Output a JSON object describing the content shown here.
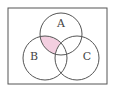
{
  "diagram": {
    "type": "venn",
    "universe": {
      "x": 8,
      "y": 8,
      "width": 99,
      "height": 76
    },
    "sets": [
      {
        "label": "A",
        "cx": 61,
        "cy": 34,
        "r": 21,
        "label_x": 61,
        "label_y": 23
      },
      {
        "label": "B",
        "cx": 45,
        "cy": 58,
        "r": 22,
        "label_x": 34,
        "label_y": 56
      },
      {
        "label": "C",
        "cx": 77,
        "cy": 58,
        "r": 22,
        "label_x": 87,
        "label_y": 56
      }
    ],
    "shaded_region": "A ∩ B ∩ C'",
    "colors": {
      "stroke": "#555555",
      "shade": "#f3cfe0",
      "border": "#555555"
    }
  }
}
